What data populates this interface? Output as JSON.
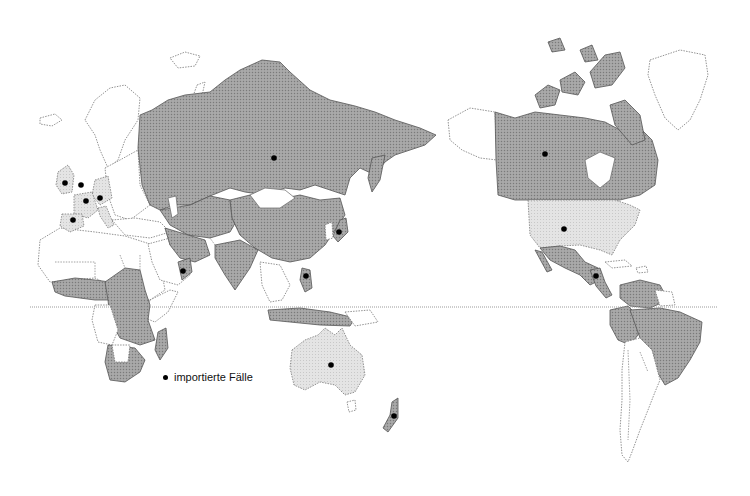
{
  "map": {
    "type": "world map, Pacific-centred, two hemispheres",
    "equator_line": true,
    "colors": {
      "affected_dark": "#9a9a9a",
      "affected_light": "#e0e0e0",
      "unaffected": "#ffffff",
      "marker": "#000000"
    },
    "regions_dark": [
      "Russia",
      "China",
      "Kazakhstan",
      "Central Asia",
      "Middle East",
      "India",
      "Japan",
      "West Africa",
      "Central Africa",
      "Southern Africa",
      "Madagascar",
      "Canada",
      "Mexico",
      "Central America",
      "Colombia",
      "Venezuela",
      "Peru",
      "Brazil",
      "Indonesia",
      "Philippines",
      "New Zealand"
    ],
    "regions_light": [
      "United Kingdom",
      "France",
      "Germany",
      "Spain",
      "Italy",
      "United States",
      "Australia"
    ],
    "markers": [
      {
        "label": "United Kingdom",
        "x": 65,
        "y": 183
      },
      {
        "label": "Netherlands",
        "x": 81,
        "y": 185
      },
      {
        "label": "France",
        "x": 86,
        "y": 201
      },
      {
        "label": "Germany",
        "x": 100,
        "y": 198
      },
      {
        "label": "Spain",
        "x": 73,
        "y": 220
      },
      {
        "label": "Russia",
        "x": 274,
        "y": 158
      },
      {
        "label": "Japan",
        "x": 339,
        "y": 232
      },
      {
        "label": "Oman",
        "x": 183,
        "y": 271
      },
      {
        "label": "Philippines",
        "x": 306,
        "y": 276
      },
      {
        "label": "Australia",
        "x": 331,
        "y": 365
      },
      {
        "label": "New Zealand",
        "x": 394,
        "y": 416
      },
      {
        "label": "Canada",
        "x": 545,
        "y": 154
      },
      {
        "label": "United States",
        "x": 564,
        "y": 229
      },
      {
        "label": "Guatemala",
        "x": 596,
        "y": 276
      }
    ]
  },
  "legend": {
    "label": "importierte Fälle"
  }
}
